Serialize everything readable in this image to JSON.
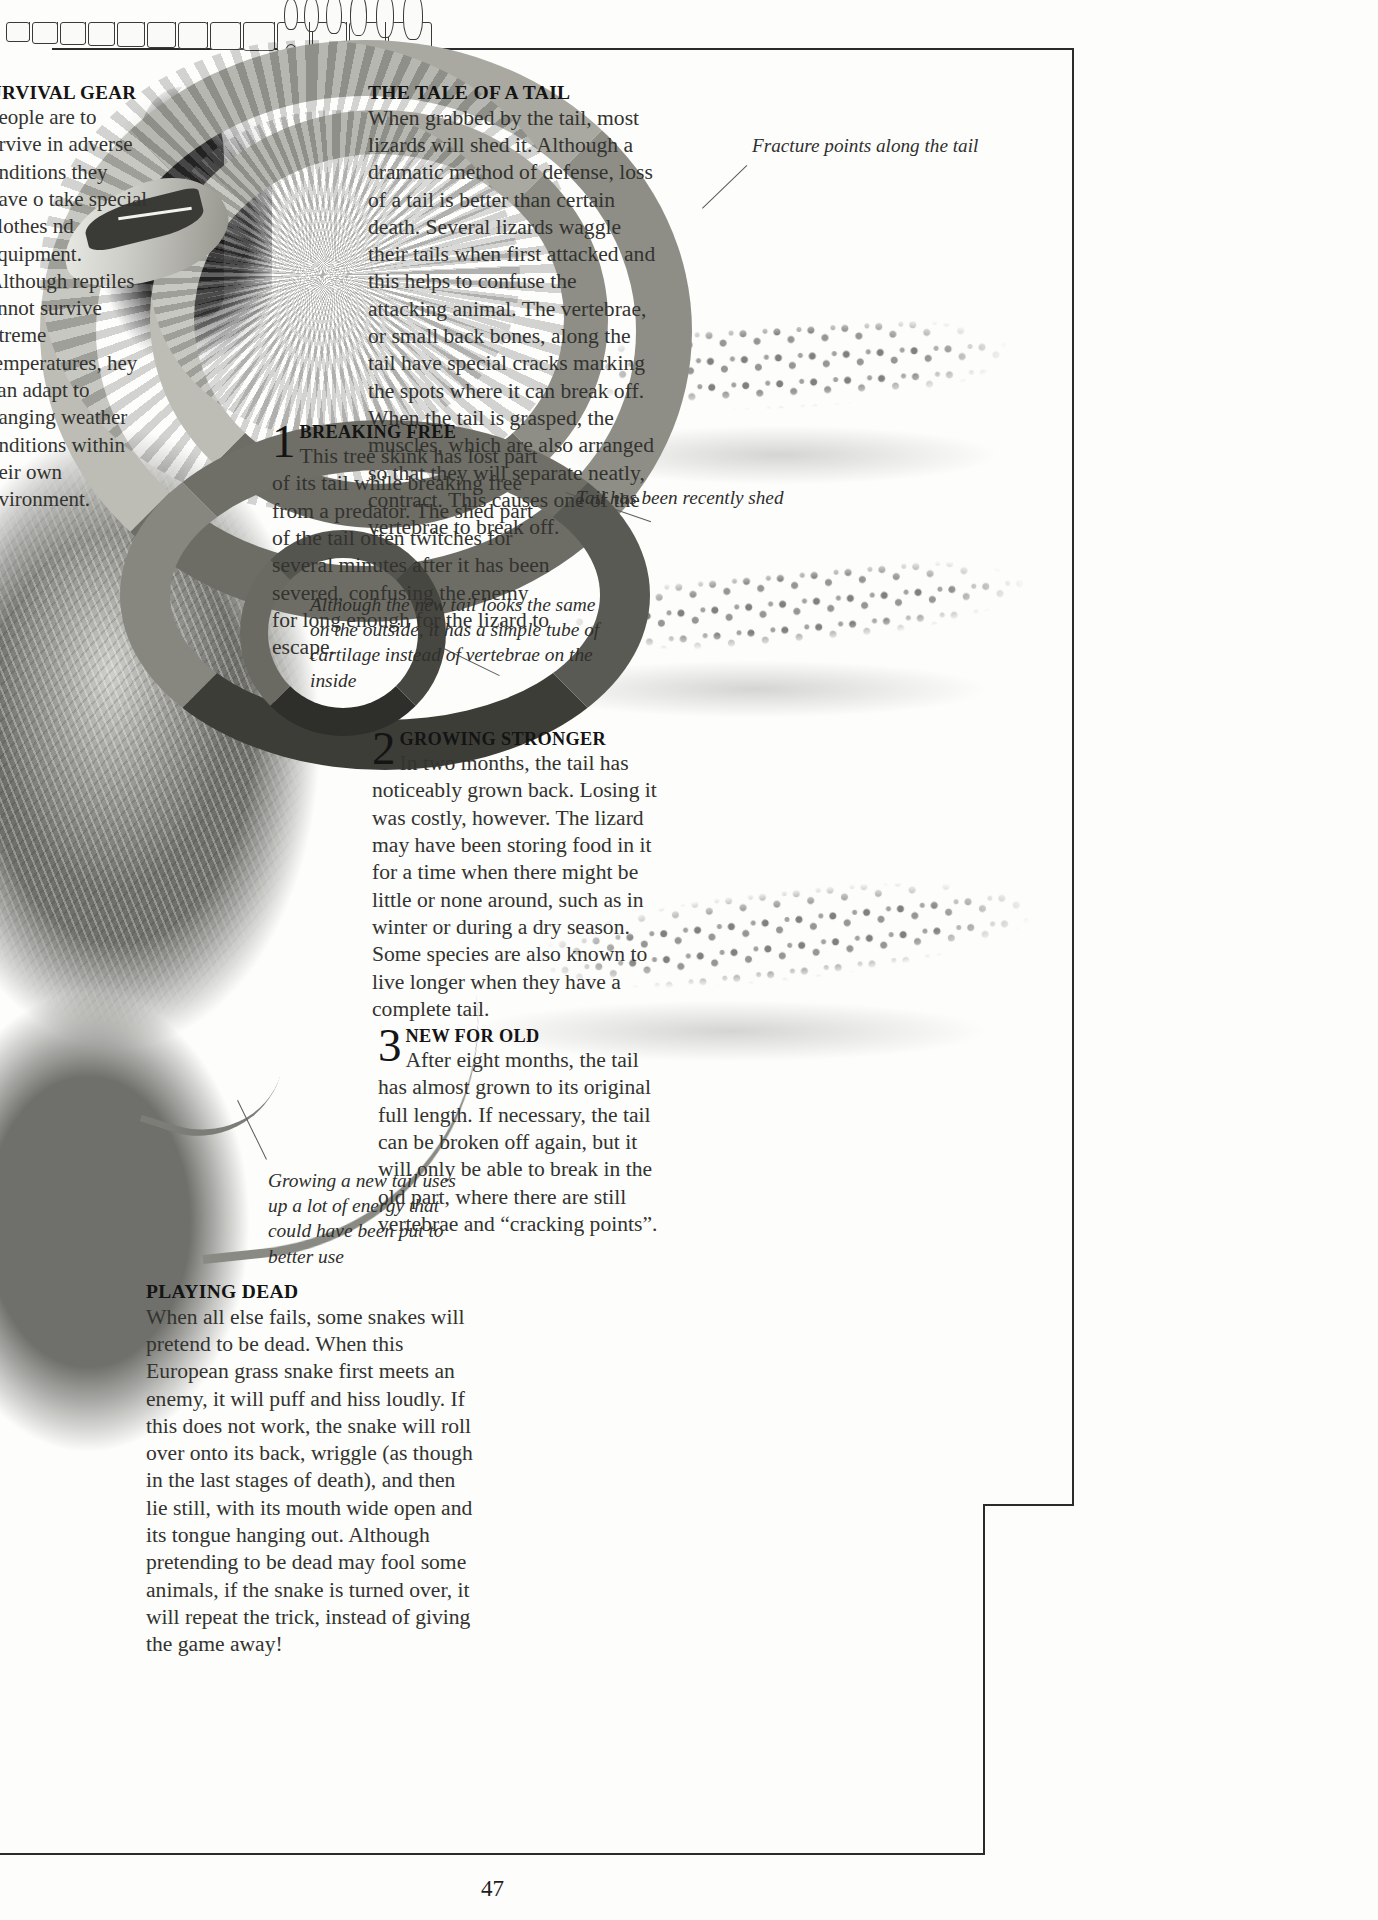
{
  "page": {
    "number": "47"
  },
  "survival_gear": {
    "heading": "URVIVAL GEAR",
    "body": "people are to urvive in adverse onditions they have o take special clothes nd equipment. Although reptiles annot survive xtreme temperatures, hey can adapt to hanging weather onditions within heir own nvironment."
  },
  "tale_of_tail": {
    "heading": "THE TALE OF A TAIL",
    "body": "When grabbed by the tail, most lizards will shed it. Although a dramatic method of defense, loss of a tail is better than certain death. Several lizards waggle their tails when first attacked and this helps to confuse the attacking animal. The vertebrae, or small back bones, along the tail have special cracks marking the spots where it can break off. When the tail is grasped, the muscles, which are also arranged so that they will separate neatly, contract. This causes one of the vertebrae to break off."
  },
  "steps": [
    {
      "number": "1",
      "heading": "BREAKING FREE",
      "body": "This tree skink has lost part of its tail while breaking free from a predator. The shed part of the tail often twitches for several minutes after it has been severed, confusing the enemy for long enough for the lizard to escape."
    },
    {
      "number": "2",
      "heading": "GROWING STRONGER",
      "body": "In two months, the tail has noticeably grown back. Losing it was costly, however. The lizard may have been storing food in it for a time when there might be little or none around, such as in winter or during a dry season. Some species are also known to live longer when they have a complete tail."
    },
    {
      "number": "3",
      "heading": "NEW FOR OLD",
      "body": "After eight months, the tail has almost grown to its original full length. If necessary, the tail can be broken off again, but it will only be able to break in the old part, where there are still vertebrae and “cracking points”."
    }
  ],
  "playing_dead": {
    "heading": "PLAYING DEAD",
    "body": "When all else fails, some snakes will pretend to be dead. When this European grass snake first meets an enemy, it will puff and hiss loudly. If this does not work, the snake will roll over onto its back, wriggle (as though in the last stages of death), and then lie still, with its mouth wide open and its tongue hanging out. Although pretending to be dead may fool some animals, if the snake is turned over, it will repeat the trick, instead of giving the game away!"
  },
  "annotations": {
    "fracture_points": "Fracture points along the tail",
    "tail_shed": "Tail has been recently shed",
    "cartilage_note": "Although the new tail looks the same on the outside, it has a simple tube of cartilage instead of vertebrae on the inside",
    "energy_note": "Growing a new tail uses up a lot of energy that could have been put to better use"
  },
  "colors": {
    "ink": "#1e1e1e",
    "body_ink": "#33332f",
    "rule": "#2b2b2b",
    "leader": "#5a5a58",
    "paper": "#fdfdfc"
  }
}
